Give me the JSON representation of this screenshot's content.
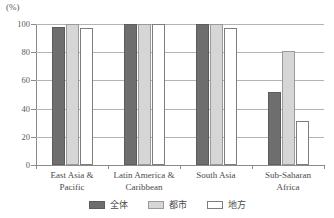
{
  "chart_data": {
    "type": "bar",
    "title": "",
    "xlabel": "",
    "ylabel": "(%)",
    "unit_label": "(%)",
    "ylim": [
      0,
      100
    ],
    "yticks": [
      0,
      20,
      40,
      60,
      80,
      100
    ],
    "ytick_labels": [
      "0",
      "20",
      "40",
      "60",
      "80",
      "100"
    ],
    "grid": true,
    "legend_position": "bottom-center",
    "categories": [
      "East Asia &\nPacific",
      "Latin America &\nCaribbean",
      "South Asia",
      "Sub-Saharan\nAfrica"
    ],
    "series": [
      {
        "name": "全体",
        "color": "#6e6e6e",
        "values": [
          98,
          100,
          100,
          52
        ]
      },
      {
        "name": "都市",
        "color": "#d6d6d6",
        "values": [
          100,
          100,
          100,
          81
        ]
      },
      {
        "name": "地方",
        "color": "#ffffff",
        "values": [
          97,
          100,
          97,
          31
        ]
      }
    ]
  },
  "legend": {
    "items": [
      {
        "label": "全体",
        "swatch": "total"
      },
      {
        "label": "都市",
        "swatch": "urban"
      },
      {
        "label": "地方",
        "swatch": "rural"
      }
    ]
  },
  "colors": {
    "total": "#6e6e6e",
    "urban": "#d6d6d6",
    "rural": "#ffffff",
    "grid": "#b3b3b3",
    "axis": "#8a8a8a",
    "text": "#4a4a4a"
  }
}
